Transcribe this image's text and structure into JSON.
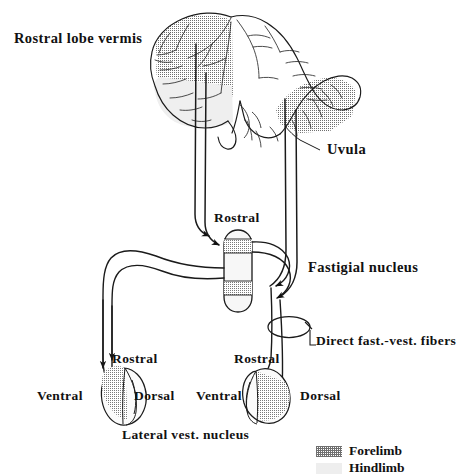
{
  "figure": {
    "background_color": "#ffffff",
    "ink_color": "#111111"
  },
  "labels": {
    "rostral_lobe_vermis": "Rostral lobe vermis",
    "uvula": "Uvula",
    "fastigial_rostral": "Rostral",
    "fastigial_nucleus": "Fastigial nucleus",
    "direct_fibers": "Direct fast.-vest. fibers",
    "left_rostral": "Rostral",
    "left_ventral": "Ventral",
    "left_dorsal": "Dorsal",
    "right_rostral": "Rostral",
    "right_ventral": "Ventral",
    "right_dorsal": "Dorsal",
    "lateral_vest_nucleus": "Lateral vest. nucleus"
  },
  "legend": {
    "items": [
      {
        "label": "Forelimb",
        "pattern": "stippled",
        "color": "#6f6f6f"
      },
      {
        "label": "Hindlimb",
        "pattern": "pale-solid",
        "color": "#eeeeee"
      }
    ]
  },
  "structures": {
    "cerebellum": {
      "name": "Cerebellum sagittal section",
      "forelimb_zones": 2,
      "hindlimb_zones": 1
    },
    "fastigial_nucleus": {
      "name": "Fastigial nucleus capsule",
      "bands": [
        "forelimb",
        "hindlimb",
        "forelimb",
        "hindlimb"
      ]
    },
    "left_vestibular_nucleus": {
      "name": "Left lateral vestibular nucleus",
      "shaded_side": "ventral"
    },
    "right_vestibular_nucleus": {
      "name": "Right lateral vestibular nucleus",
      "shaded_side": "dorsal"
    }
  },
  "annotations": {
    "descending_fiber_lines": 4,
    "arrowheads_into_fastigial": 4,
    "arrowheads_into_vestibular": 4,
    "encircled_bundle": "Direct fastigio-vestibular fibers"
  }
}
